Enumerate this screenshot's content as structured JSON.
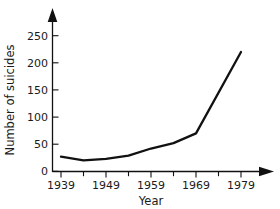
{
  "chart_data": {
    "type": "line",
    "title": "",
    "xlabel": "Year",
    "ylabel": "Number of suicides",
    "xlim": [
      1937,
      1984
    ],
    "ylim": [
      0,
      270
    ],
    "grid": false,
    "legend": null,
    "x_major_ticks": [
      1939,
      1949,
      1959,
      1969,
      1979
    ],
    "x_major_tick_labels": [
      "1939",
      "1949",
      "1959",
      "1969",
      "1979"
    ],
    "x_minor_ticks": [
      1944,
      1954,
      1964,
      1974
    ],
    "y_ticks": [
      0,
      50,
      100,
      150,
      200,
      250
    ],
    "y_tick_labels": [
      "0",
      "50",
      "100",
      "150",
      "200",
      "250"
    ],
    "x": [
      1939,
      1944,
      1949,
      1954,
      1959,
      1964,
      1969,
      1979
    ],
    "values": [
      27,
      20,
      23,
      29,
      42,
      52,
      70,
      220
    ],
    "series": [
      {
        "name": "Number of suicides",
        "color": "#111111",
        "x": [
          1939,
          1944,
          1949,
          1954,
          1959,
          1964,
          1969,
          1979
        ],
        "values": [
          27,
          20,
          23,
          29,
          42,
          52,
          70,
          220
        ]
      }
    ],
    "axis_style": {
      "x_axis_arrow": true,
      "y_axis_arrow": true,
      "line_color": "#111111"
    }
  },
  "labels": {
    "y_axis_title": "Number of suicides",
    "x_axis_title": "Year",
    "y_250": "250",
    "y_200": "200",
    "y_150": "150",
    "y_100": "100",
    "y_50": "50",
    "y_0": "0",
    "x_1939": "1939",
    "x_1949": "1949",
    "x_1959": "1959",
    "x_1969": "1969",
    "x_1979": "1979"
  }
}
